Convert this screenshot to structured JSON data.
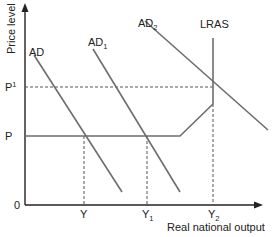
{
  "diagram": {
    "type": "economics-ad-as",
    "y_axis_label": "Price level",
    "x_axis_label": "Real national output",
    "origin_label": "0",
    "price_levels": [
      {
        "id": "P",
        "base": "P",
        "sup": ""
      },
      {
        "id": "P1",
        "base": "P",
        "sup": "1"
      }
    ],
    "output_levels": [
      {
        "id": "Y",
        "base": "Y",
        "sub": ""
      },
      {
        "id": "Y1",
        "base": "Y",
        "sub": "1"
      },
      {
        "id": "Y2",
        "base": "Y",
        "sub": "2"
      }
    ],
    "curves": [
      {
        "id": "AD",
        "base": "AD",
        "sub": ""
      },
      {
        "id": "AD1",
        "base": "AD",
        "sub": "1"
      },
      {
        "id": "AD2",
        "base": "AD",
        "sub": "2"
      },
      {
        "id": "LRAS",
        "base": "LRAS",
        "sub": ""
      }
    ],
    "colors": {
      "axis": "#222222",
      "curve": "#6d6d6d",
      "dashed": "#555555"
    }
  }
}
